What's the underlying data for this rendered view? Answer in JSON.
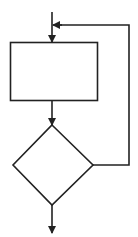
{
  "diagram": {
    "type": "flowchart-loop",
    "stroke_color": "#222222",
    "background": "#ffffff",
    "nodes": [
      {
        "id": "process",
        "shape": "rectangle",
        "label": ""
      },
      {
        "id": "decision",
        "shape": "diamond",
        "label": ""
      }
    ],
    "edges": [
      {
        "from": "entry",
        "to": "process",
        "arrow": "down"
      },
      {
        "from": "process",
        "to": "decision",
        "arrow": "down"
      },
      {
        "from": "decision",
        "to": "process",
        "path": "right-up-left",
        "arrow": "left"
      },
      {
        "from": "decision",
        "to": "exit",
        "arrow": "down"
      }
    ]
  }
}
